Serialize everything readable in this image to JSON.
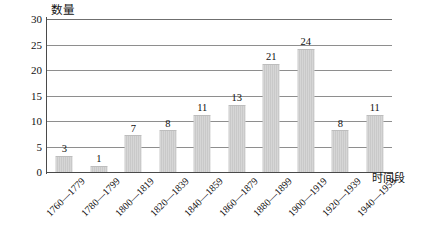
{
  "chart_data": {
    "type": "bar",
    "title": "",
    "subtitle": "",
    "xlabel": "时间段",
    "ylabel": "数量",
    "categories": [
      "1760—1779",
      "1780—1799",
      "1800—1819",
      "1820—1839",
      "1840—1859",
      "1860—1879",
      "1880—1899",
      "1900—1919",
      "1920—1939",
      "1940—1959"
    ],
    "values": [
      3,
      1,
      7,
      8,
      11,
      13,
      21,
      24,
      8,
      11
    ],
    "ylim": [
      0,
      30
    ],
    "yticks": [
      0,
      5,
      10,
      15,
      20,
      25,
      30
    ],
    "ytick_labels": [
      "0",
      "5",
      "10",
      "15",
      "20",
      "25",
      "30"
    ],
    "data_labels": [
      "3",
      "1",
      "7",
      "8",
      "11",
      "13",
      "21",
      "24",
      "8",
      "11"
    ],
    "grid": true,
    "grid_axis": "y",
    "legend": false,
    "legend_position": "none",
    "bar_color": "#cfcfcf",
    "grid_color": "#8e8e8e",
    "axis_color": "#4a4a4a",
    "text_color": "#111111",
    "background": "#ffffff"
  }
}
